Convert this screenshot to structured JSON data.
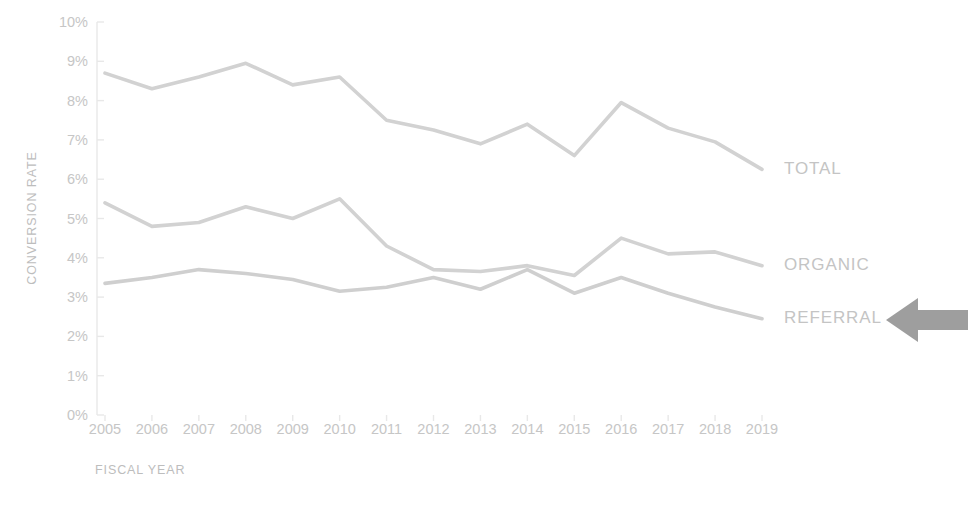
{
  "chart_data": {
    "type": "line",
    "title": "",
    "xlabel": "FISCAL YEAR",
    "ylabel": "CONVERSION RATE",
    "categories": [
      "2005",
      "2006",
      "2007",
      "2008",
      "2009",
      "2010",
      "2011",
      "2012",
      "2013",
      "2014",
      "2015",
      "2016",
      "2017",
      "2018",
      "2019"
    ],
    "x": [
      2005,
      2006,
      2007,
      2008,
      2009,
      2010,
      2011,
      2012,
      2013,
      2014,
      2015,
      2016,
      2017,
      2018,
      2019
    ],
    "ylim": [
      0,
      10
    ],
    "xlim": [
      2005,
      2019
    ],
    "y_tick_labels": [
      "0%",
      "1%",
      "2%",
      "3%",
      "4%",
      "5%",
      "6%",
      "7%",
      "8%",
      "9%",
      "10%"
    ],
    "y_tick_values": [
      0,
      1,
      2,
      3,
      4,
      5,
      6,
      7,
      8,
      9,
      10
    ],
    "y_unit": "%",
    "grid": false,
    "legend_position": "right-inline",
    "series": [
      {
        "name": "TOTAL",
        "color": "#d2d2d2",
        "values": [
          8.7,
          8.3,
          8.6,
          8.95,
          8.4,
          8.6,
          7.5,
          7.25,
          6.9,
          7.4,
          6.6,
          7.95,
          7.3,
          6.95,
          6.25
        ]
      },
      {
        "name": "ORGANIC",
        "color": "#d2d2d2",
        "values": [
          5.4,
          4.8,
          4.9,
          5.3,
          5.0,
          5.5,
          4.3,
          3.7,
          3.65,
          3.8,
          3.55,
          4.5,
          4.1,
          4.15,
          3.8
        ]
      },
      {
        "name": "REFERRAL",
        "color": "#cfcfcf",
        "values": [
          3.35,
          3.5,
          3.7,
          3.6,
          3.45,
          3.15,
          3.25,
          3.5,
          3.2,
          3.7,
          3.1,
          3.5,
          3.1,
          2.75,
          2.45
        ]
      }
    ],
    "annotations": [
      {
        "kind": "arrow",
        "icon": "left-arrow-icon",
        "points_to": "REFERRAL",
        "color": "#9e9e9e"
      }
    ]
  },
  "colors": {
    "background": "#ffffff",
    "line": "#d2d2d2",
    "tick_text": "#c6c6c6",
    "axis_title_text": "#bdbdbd",
    "series_label_text": "#c4c4c4",
    "axis_rule": "#e8e8e8",
    "arrow": "#9e9e9e"
  }
}
